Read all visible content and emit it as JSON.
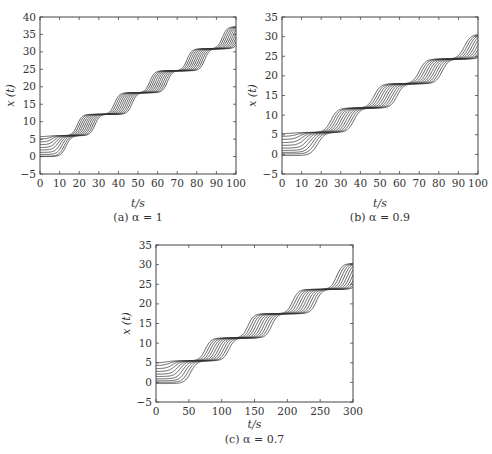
{
  "chart_data": [
    {
      "type": "line",
      "id": "a",
      "caption": "(a) α = 1",
      "xlabel": "t/s",
      "ylabel": "x (t)",
      "xlim": [
        0,
        100
      ],
      "ylim": [
        -5,
        40
      ],
      "xticks": [
        0,
        10,
        20,
        30,
        40,
        50,
        60,
        70,
        80,
        90,
        100
      ],
      "yticks": [
        -5,
        0,
        5,
        10,
        15,
        20,
        25,
        30,
        35,
        40
      ],
      "frame": {
        "left": 40,
        "top": 17,
        "right": 236,
        "bottom": 174
      },
      "n_curves": 10,
      "initial_values": [
        5.7,
        5,
        4.2,
        3.4,
        2.6,
        1.9,
        1.2,
        0.6,
        0.1,
        0
      ],
      "plateaus": [
        6,
        12.1,
        18.3,
        24.6,
        30.9,
        37.2
      ],
      "step_times": [
        1,
        19,
        38,
        56,
        75,
        93
      ],
      "curve_spacing": 1.0,
      "rise_width": 2.2,
      "grid": false
    },
    {
      "type": "line",
      "id": "b",
      "caption": "(b) α = 0.9",
      "xlabel": "t/s",
      "ylabel": "x (t)",
      "xlim": [
        0,
        100
      ],
      "ylim": [
        -5,
        35
      ],
      "xticks": [
        0,
        10,
        20,
        30,
        40,
        50,
        60,
        70,
        80,
        90,
        100
      ],
      "yticks": [
        -5,
        0,
        5,
        10,
        15,
        20,
        25,
        30,
        35
      ],
      "frame": {
        "left": 282,
        "top": 17,
        "right": 478,
        "bottom": 174
      },
      "n_curves": 10,
      "initial_values": [
        5.3,
        4.6,
        3.8,
        3.0,
        2.3,
        1.6,
        1.0,
        0.5,
        0.1,
        -0.3
      ],
      "plateaus": [
        5.6,
        11.8,
        18,
        24.3,
        30.6
      ],
      "step_times": [
        2,
        25,
        47,
        70,
        93
      ],
      "curve_spacing": 1.3,
      "rise_width": 3.0,
      "grid": false
    },
    {
      "type": "line",
      "id": "c",
      "caption": "(c) α = 0.7",
      "xlabel": "t/s",
      "ylabel": "x (t)",
      "xlim": [
        0,
        300
      ],
      "ylim": [
        -5,
        35
      ],
      "xticks": [
        0,
        50,
        100,
        150,
        200,
        250,
        300
      ],
      "yticks": [
        -5,
        0,
        5,
        10,
        15,
        20,
        25,
        30,
        35
      ],
      "frame": {
        "left": 156,
        "top": 245,
        "right": 353,
        "bottom": 402
      },
      "n_curves": 10,
      "initial_values": [
        5.0,
        4.3,
        3.5,
        2.8,
        2.1,
        1.5,
        0.9,
        0.4,
        0,
        -0.3
      ],
      "plateaus": [
        5.5,
        11.3,
        17.5,
        23.7,
        30.3
      ],
      "step_times": [
        5,
        75,
        140,
        208,
        275
      ],
      "curve_spacing": 4.0,
      "rise_width": 8.0,
      "grid": false
    }
  ]
}
